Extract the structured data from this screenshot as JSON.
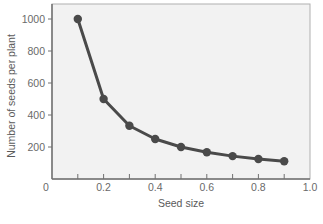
{
  "chart_data": {
    "type": "line",
    "title": "",
    "xlabel": "Seed size",
    "ylabel": "Number of seeds per plant",
    "x": [
      0.1,
      0.2,
      0.3,
      0.4,
      0.5,
      0.6,
      0.7,
      0.8,
      0.9
    ],
    "series": [
      {
        "name": "Seeds per plant",
        "values": [
          1000,
          500,
          333,
          250,
          200,
          167,
          143,
          125,
          111
        ]
      }
    ],
    "xlim": [
      0,
      1.0
    ],
    "ylim": [
      0,
      1090
    ],
    "x_ticks": [
      0.1,
      0.2,
      0.3,
      0.4,
      0.5,
      0.6,
      0.7,
      0.8,
      0.9
    ],
    "x_tick_labels": [
      {
        "value": 0,
        "label": "0"
      },
      {
        "value": 0.2,
        "label": "0.2"
      },
      {
        "value": 0.4,
        "label": "0.4"
      },
      {
        "value": 0.6,
        "label": "0.6"
      },
      {
        "value": 0.8,
        "label": "0.8"
      },
      {
        "value": 1.0,
        "label": "1.0"
      }
    ],
    "y_tick_labels": [
      {
        "value": 200,
        "label": "200"
      },
      {
        "value": 400,
        "label": "400"
      },
      {
        "value": 600,
        "label": "600"
      },
      {
        "value": 800,
        "label": "800"
      },
      {
        "value": 1000,
        "label": "1000"
      }
    ],
    "grid": false,
    "legend": "none",
    "colors": {
      "plot_background": "#f2f2f2",
      "line": "#4a4a4a",
      "marker": "#4a4a4a",
      "axis": "#707070",
      "frame": "#b0b0b0"
    }
  }
}
